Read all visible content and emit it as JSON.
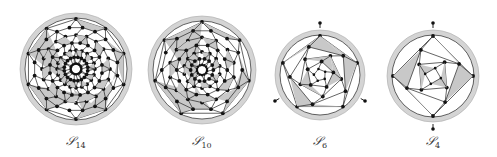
{
  "figure": {
    "panels": [
      {
        "id": "S14",
        "label_main": "𝒮",
        "label_sub": "14",
        "cx": 76,
        "cy": 69,
        "r": 56,
        "sides": 10,
        "rings": 7,
        "shaded_outer": true
      },
      {
        "id": "S10",
        "label_main": "𝒮",
        "label_sub": "10",
        "cx": 202,
        "cy": 70,
        "r": 54,
        "sides": 7,
        "rings": 7,
        "shaded_outer": true
      },
      {
        "id": "S6",
        "label_main": "𝒮",
        "label_sub": "6",
        "cx": 320,
        "cy": 75,
        "r": 45,
        "sides": 5,
        "rings": 5,
        "shaded_outer": true
      },
      {
        "id": "S4",
        "label_main": "𝒮",
        "label_sub": "4",
        "cx": 433,
        "cy": 76,
        "r": 46,
        "sides": 4,
        "rings": 4,
        "shaded_outer": true
      }
    ],
    "colors": {
      "shade": "#c8c8c8",
      "ring": "#d4d4d4",
      "line": "#222222",
      "node": "#111111"
    }
  }
}
